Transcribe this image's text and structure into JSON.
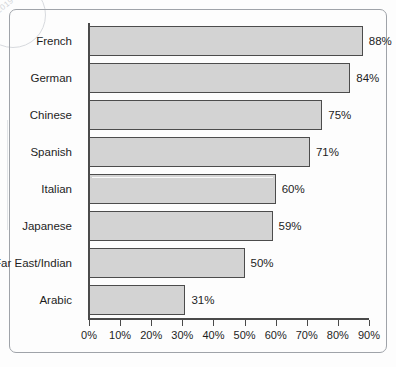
{
  "chart_data": {
    "type": "bar",
    "orientation": "horizontal",
    "title": "",
    "xlabel": "",
    "ylabel": "",
    "xlim": [
      0,
      90
    ],
    "xtick_step": 10,
    "grid": false,
    "legend": false,
    "value_suffix": "%",
    "categories": [
      "French",
      "German",
      "Chinese",
      "Spanish",
      "Italian",
      "Japanese",
      "Far East/Indian",
      "Arabic"
    ],
    "values": [
      88,
      84,
      75,
      71,
      60,
      59,
      50,
      31
    ],
    "value_labels": [
      "88%",
      "84%",
      "75%",
      "71%",
      "60%",
      "59%",
      "50%",
      "31%"
    ],
    "xticks": [
      0,
      10,
      20,
      30,
      40,
      50,
      60,
      70,
      80,
      90
    ],
    "xtick_labels": [
      "0%",
      "10%",
      "20%",
      "30%",
      "40%",
      "50%",
      "60%",
      "70%",
      "80%",
      "90%"
    ],
    "colors": {
      "bar_fill": "#d3d3d3",
      "bar_border": "#4c4c4c",
      "axis": "#4a4a4a",
      "text": "#1d1d1d",
      "frame": "#9fa3a9",
      "background": "#fdfdfd"
    }
  },
  "watermark": {
    "text": "2019"
  }
}
